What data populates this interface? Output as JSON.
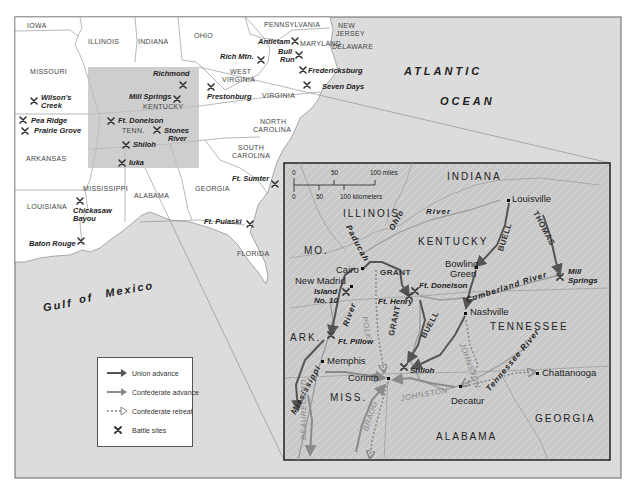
{
  "map": {
    "overview": {
      "states": [
        {
          "name": "IOWA",
          "x": 27,
          "y": 22
        },
        {
          "name": "ILLINOIS",
          "x": 88,
          "y": 38
        },
        {
          "name": "INDIANA",
          "x": 138,
          "y": 38
        },
        {
          "name": "OHIO",
          "x": 194,
          "y": 32
        },
        {
          "name": "PENNSYLVANIA",
          "x": 264,
          "y": 21
        },
        {
          "name": "NEW",
          "x": 338,
          "y": 22
        },
        {
          "name": "JERSEY",
          "x": 336,
          "y": 30
        },
        {
          "name": "DELAWARE",
          "x": 332,
          "y": 43
        },
        {
          "name": "MARYLAND",
          "x": 300,
          "y": 40
        },
        {
          "name": "MISSOURI",
          "x": 30,
          "y": 68
        },
        {
          "name": "WEST",
          "x": 230,
          "y": 68
        },
        {
          "name": "VIRGINIA",
          "x": 222,
          "y": 76
        },
        {
          "name": "VIRGINIA",
          "x": 262,
          "y": 92
        },
        {
          "name": "KENTUCKY",
          "x": 143,
          "y": 103
        },
        {
          "name": "TENN.",
          "x": 122,
          "y": 127
        },
        {
          "name": "NORTH",
          "x": 260,
          "y": 118
        },
        {
          "name": "CAROLINA",
          "x": 253,
          "y": 126
        },
        {
          "name": "SOUTH",
          "x": 238,
          "y": 144
        },
        {
          "name": "CAROLINA",
          "x": 232,
          "y": 152
        },
        {
          "name": "ARKANSAS",
          "x": 26,
          "y": 155
        },
        {
          "name": "MISSISSIPPI",
          "x": 83,
          "y": 185
        },
        {
          "name": "ALABAMA",
          "x": 134,
          "y": 192
        },
        {
          "name": "GEORGIA",
          "x": 195,
          "y": 185
        },
        {
          "name": "LOUISIANA",
          "x": 27,
          "y": 203
        },
        {
          "name": "FLORIDA",
          "x": 237,
          "y": 250
        }
      ],
      "battles": [
        {
          "name": "Antietam",
          "x": 258,
          "y": 38,
          "mx": 295,
          "my": 41
        },
        {
          "name": "Bull",
          "x": 278,
          "y": 48,
          "mx": 299,
          "my": 55
        },
        {
          "name": "Run",
          "x": 280,
          "y": 56
        },
        {
          "name": "Rich Mtn.",
          "x": 220,
          "y": 53,
          "mx": 261,
          "my": 60
        },
        {
          "name": "Fredericksburg",
          "x": 308,
          "y": 67,
          "mx": 303,
          "my": 70
        },
        {
          "name": "Seven Days",
          "x": 322,
          "y": 83,
          "mx": 307,
          "my": 85
        },
        {
          "name": "Richmond",
          "x": 153,
          "y": 70,
          "mx": 183,
          "my": 85
        },
        {
          "name": "Mill Springs",
          "x": 129,
          "y": 93,
          "mx": 177,
          "my": 99
        },
        {
          "name": "Prestonburg",
          "x": 207,
          "y": 93,
          "mx": 211,
          "my": 87
        },
        {
          "name": "Wilson's",
          "x": 41,
          "y": 94,
          "mx": 34,
          "my": 101
        },
        {
          "name": "Creek",
          "x": 41,
          "y": 102
        },
        {
          "name": "Pea Ridge",
          "x": 31,
          "y": 117,
          "mx": 23,
          "my": 120
        },
        {
          "name": "Prairie Grove",
          "x": 34,
          "y": 127,
          "mx": 25,
          "my": 131
        },
        {
          "name": "Ft. Donelson",
          "x": 118,
          "y": 117,
          "mx": 111,
          "my": 121
        },
        {
          "name": "Stones",
          "x": 164,
          "y": 127,
          "mx": 157,
          "my": 130
        },
        {
          "name": "River",
          "x": 168,
          "y": 135
        },
        {
          "name": "Shiloh",
          "x": 133,
          "y": 141,
          "mx": 126,
          "my": 145
        },
        {
          "name": "Iuka",
          "x": 129,
          "y": 159,
          "mx": 122,
          "my": 163
        },
        {
          "name": "Ft. Sumter",
          "x": 232,
          "y": 175,
          "mx": 275,
          "my": 184
        },
        {
          "name": "Chickasaw",
          "x": 73,
          "y": 207,
          "mx": 80,
          "my": 201
        },
        {
          "name": "Bayou",
          "x": 73,
          "y": 215
        },
        {
          "name": "Ft. Pulaski",
          "x": 204,
          "y": 218,
          "mx": 250,
          "my": 224
        },
        {
          "name": "Baton Rouge",
          "x": 29,
          "y": 240,
          "mx": 81,
          "my": 241
        }
      ],
      "water": [
        {
          "name": "ATLANTIC",
          "x": 404,
          "y": 66
        },
        {
          "name": "OCEAN",
          "x": 440,
          "y": 96
        },
        {
          "name": "Gulf",
          "x": 43,
          "y": 300
        },
        {
          "name": "of",
          "x": 79,
          "y": 293
        },
        {
          "name": "Mexico",
          "x": 105,
          "y": 284
        }
      ]
    },
    "inset": {
      "scale": {
        "miles_label": "100 miles",
        "km_label": "100 kilometers",
        "ticks_mi": [
          "0",
          "50"
        ],
        "ticks_km": [
          "0",
          "50"
        ]
      },
      "states": [
        {
          "name": "INDIANA",
          "x": 447,
          "y": 172
        },
        {
          "name": "ILLINOIS",
          "x": 343,
          "y": 209
        },
        {
          "name": "KENTUCKY",
          "x": 418,
          "y": 237
        },
        {
          "name": "MO.",
          "x": 304,
          "y": 246
        },
        {
          "name": "ARK.",
          "x": 290,
          "y": 333
        },
        {
          "name": "TENNESSEE",
          "x": 490,
          "y": 322
        },
        {
          "name": "MISS.",
          "x": 330,
          "y": 393
        },
        {
          "name": "GEORGIA",
          "x": 535,
          "y": 414
        },
        {
          "name": "ALABAMA",
          "x": 436,
          "y": 432
        }
      ],
      "cities": [
        {
          "name": "Louisville",
          "x": 512,
          "y": 194,
          "dx": 509,
          "dy": 201
        },
        {
          "name": "Bowling",
          "x": 445,
          "y": 259
        },
        {
          "name": "Green",
          "x": 450,
          "y": 269,
          "dx": 476,
          "dy": 267
        },
        {
          "name": "Cairo",
          "x": 336,
          "y": 265,
          "dx": 362,
          "dy": 268
        },
        {
          "name": "New Madrid",
          "x": 295,
          "y": 276,
          "dx": 351,
          "dy": 286
        },
        {
          "name": "Nashville",
          "x": 470,
          "y": 307,
          "dx": 465,
          "dy": 313
        },
        {
          "name": "Memphis",
          "x": 327,
          "y": 356,
          "dx": 322,
          "dy": 361
        },
        {
          "name": "Corinth",
          "x": 348,
          "y": 373,
          "dx": 388,
          "dy": 378
        },
        {
          "name": "Decatur",
          "x": 451,
          "y": 396,
          "dx": 460,
          "dy": 386
        },
        {
          "name": "Chattanooga",
          "x": 542,
          "y": 368,
          "dx": 537,
          "dy": 373
        }
      ],
      "battles": [
        {
          "name": "Island",
          "x": 314,
          "y": 288,
          "mx": 346,
          "my": 292
        },
        {
          "name": "No. 10",
          "x": 314,
          "y": 297
        },
        {
          "name": "Ft. Henry",
          "x": 378,
          "y": 298,
          "mx": 409,
          "my": 296
        },
        {
          "name": "Ft. Donelson",
          "x": 419,
          "y": 282,
          "mx": 414,
          "my": 291
        },
        {
          "name": "Mill",
          "x": 568,
          "y": 268,
          "mx": 560,
          "my": 277
        },
        {
          "name": "Springs",
          "x": 568,
          "y": 277
        },
        {
          "name": "Ft. Pillow",
          "x": 338,
          "y": 338,
          "mx": 331,
          "my": 335
        },
        {
          "name": "Shiloh",
          "x": 410,
          "y": 367,
          "mx": 404,
          "my": 367
        }
      ],
      "rivers": [
        {
          "name": "River",
          "x": 426,
          "y": 208
        },
        {
          "name": "Ohio",
          "x": 388,
          "y": 228,
          "rot": -60
        },
        {
          "name": "Paducah",
          "x": 351,
          "y": 224,
          "rot": 62
        },
        {
          "name": "River",
          "x": 342,
          "y": 325,
          "rot": -70
        },
        {
          "name": "Cumberland River",
          "x": 465,
          "y": 297,
          "rot": -18
        },
        {
          "name": "Tennessee River",
          "x": 485,
          "y": 388,
          "rot": -50
        },
        {
          "name": "Mississippi",
          "x": 290,
          "y": 412,
          "rot": -62
        }
      ],
      "commanders": [
        {
          "name": "GRANT",
          "x": 380,
          "y": 269,
          "rot": 0,
          "style": "dark"
        },
        {
          "name": "GRANT",
          "x": 388,
          "y": 335,
          "rot": -78,
          "style": "dark"
        },
        {
          "name": "BUELL",
          "x": 497,
          "y": 250,
          "rot": -72,
          "style": "dark"
        },
        {
          "name": "BUELL",
          "x": 420,
          "y": 336,
          "rot": -62,
          "style": "dark"
        },
        {
          "name": "THOMAS",
          "x": 538,
          "y": 210,
          "rot": 62,
          "style": "dark"
        },
        {
          "name": "POLK",
          "x": 368,
          "y": 316,
          "rot": 80,
          "style": "light"
        },
        {
          "name": "JOHNSTON",
          "x": 465,
          "y": 342,
          "rot": 70,
          "style": "light"
        },
        {
          "name": "JOHNSTON",
          "x": 400,
          "y": 395,
          "rot": -10,
          "style": "light"
        },
        {
          "name": "BEAUREGARD",
          "x": 300,
          "y": 440,
          "rot": -90,
          "style": "light"
        },
        {
          "name": "BRAGG",
          "x": 362,
          "y": 430,
          "rot": -72,
          "style": "light"
        }
      ]
    }
  },
  "legend": {
    "items": [
      {
        "label": "Union advance",
        "symbol": "union-arrow"
      },
      {
        "label": "Confederate advance",
        "symbol": "confederate-arrow"
      },
      {
        "label": "Confederate retreat",
        "symbol": "retreat-arrow"
      },
      {
        "label": "Battle sites",
        "symbol": "battle-x"
      }
    ]
  },
  "colors": {
    "land": "#ffffff",
    "water": "#dcdcdc",
    "highlight": "#bdbdbd",
    "inset_bg": "#c9c9c9",
    "union": "#555555",
    "confederate": "#8a8a8a",
    "border": "#333333"
  }
}
